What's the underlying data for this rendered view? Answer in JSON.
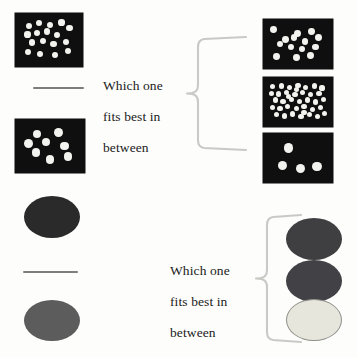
{
  "page": {
    "title": "Which one fits best in between",
    "background_color": "#fdfdfc",
    "width": 357,
    "height": 358
  },
  "palette": {
    "panel_background": "#100f0f",
    "dot_color": "#f2f2ee",
    "rule_color": "#7d7d7d",
    "brace_color": "#c9c9c5",
    "text_color": "#1b1b1b",
    "ellipse_dark": "#2a2a2a",
    "ellipse_medium_dark": "#3f3f42",
    "ellipse_medium": "#5c5c5c",
    "ellipse_light": "#e6e6dc",
    "ellipse_light_outline": "#8e8e8a"
  },
  "items": {
    "top_prompt": {
      "label": "Which one\nfits best in\nbetween",
      "line1": "Which one",
      "line2": "fits best in",
      "line3": "between"
    },
    "bottom_prompt": {
      "label": "Which one\nfits best in\nbetween",
      "line1": "Which one",
      "line2": "fits best in",
      "line3": "between"
    }
  },
  "stimuli": {
    "top_left_anchor_high": {
      "name": "dot-panel-dense-16",
      "dot_count": 16,
      "dot_radius": 3.1,
      "dots": [
        [
          0.15,
          0.17
        ],
        [
          0.33,
          0.1
        ],
        [
          0.52,
          0.15
        ],
        [
          0.72,
          0.09
        ],
        [
          0.12,
          0.37
        ],
        [
          0.29,
          0.33
        ],
        [
          0.47,
          0.3
        ],
        [
          0.64,
          0.38
        ],
        [
          0.86,
          0.22
        ],
        [
          0.2,
          0.56
        ],
        [
          0.4,
          0.52
        ],
        [
          0.58,
          0.6
        ],
        [
          0.8,
          0.54
        ],
        [
          0.13,
          0.78
        ],
        [
          0.34,
          0.82
        ],
        [
          0.6,
          0.85
        ],
        [
          0.84,
          0.76
        ]
      ]
    },
    "top_left_anchor_low": {
      "name": "dot-panel-sparse-8",
      "dot_count": 8,
      "dot_radius": 4.4,
      "dots": [
        [
          0.27,
          0.2
        ],
        [
          0.65,
          0.16
        ],
        [
          0.12,
          0.44
        ],
        [
          0.43,
          0.4
        ],
        [
          0.76,
          0.5
        ],
        [
          0.25,
          0.67
        ],
        [
          0.5,
          0.83
        ],
        [
          0.82,
          0.77
        ]
      ]
    },
    "top_right_option_a": {
      "name": "dot-panel-option-a-13",
      "dot_count": 13,
      "dot_radius": 3.4,
      "dots": [
        [
          0.08,
          0.13
        ],
        [
          0.49,
          0.22
        ],
        [
          0.73,
          0.17
        ],
        [
          0.28,
          0.38
        ],
        [
          0.43,
          0.34
        ],
        [
          0.62,
          0.44
        ],
        [
          0.85,
          0.33
        ],
        [
          0.19,
          0.5
        ],
        [
          0.38,
          0.58
        ],
        [
          0.57,
          0.63
        ],
        [
          0.8,
          0.58
        ],
        [
          0.13,
          0.82
        ],
        [
          0.48,
          0.85
        ],
        [
          0.72,
          0.8
        ]
      ]
    },
    "top_right_option_b": {
      "name": "dot-panel-option-b-38",
      "dot_count": 38,
      "dot_radius": 2.6,
      "dots": [
        [
          0.08,
          0.12
        ],
        [
          0.22,
          0.1
        ],
        [
          0.36,
          0.14
        ],
        [
          0.5,
          0.09
        ],
        [
          0.63,
          0.13
        ],
        [
          0.78,
          0.1
        ],
        [
          0.9,
          0.15
        ],
        [
          0.06,
          0.28
        ],
        [
          0.18,
          0.3
        ],
        [
          0.31,
          0.26
        ],
        [
          0.45,
          0.31
        ],
        [
          0.58,
          0.27
        ],
        [
          0.71,
          0.32
        ],
        [
          0.85,
          0.28
        ],
        [
          0.12,
          0.45
        ],
        [
          0.25,
          0.48
        ],
        [
          0.39,
          0.43
        ],
        [
          0.52,
          0.49
        ],
        [
          0.66,
          0.45
        ],
        [
          0.79,
          0.5
        ],
        [
          0.92,
          0.44
        ],
        [
          0.07,
          0.63
        ],
        [
          0.2,
          0.66
        ],
        [
          0.33,
          0.61
        ],
        [
          0.47,
          0.67
        ],
        [
          0.6,
          0.62
        ],
        [
          0.74,
          0.68
        ],
        [
          0.88,
          0.63
        ],
        [
          0.14,
          0.82
        ],
        [
          0.27,
          0.85
        ],
        [
          0.41,
          0.8
        ],
        [
          0.55,
          0.86
        ],
        [
          0.69,
          0.81
        ],
        [
          0.83,
          0.86
        ],
        [
          0.94,
          0.78
        ],
        [
          0.34,
          0.37
        ],
        [
          0.6,
          0.77
        ],
        [
          0.47,
          0.19
        ]
      ]
    },
    "top_right_option_c": {
      "name": "dot-panel-option-c-4",
      "dot_count": 4,
      "dot_radius": 4.6,
      "dots": [
        [
          0.33,
          0.22
        ],
        [
          0.22,
          0.72
        ],
        [
          0.55,
          0.79
        ],
        [
          0.84,
          0.73
        ]
      ]
    },
    "bottom_left_anchor_high": {
      "name": "ellipse-anchor-dark",
      "shade": "#2a2a2a"
    },
    "bottom_left_anchor_low": {
      "name": "ellipse-anchor-medium",
      "shade": "#5c5c5c"
    },
    "bottom_right_option_a": {
      "name": "ellipse-option-a-dark",
      "shade": "#3f3f42"
    },
    "bottom_right_option_b": {
      "name": "ellipse-option-b-medium-dark",
      "shade": "#424246"
    },
    "bottom_right_option_c": {
      "name": "ellipse-option-c-light",
      "shade": "#e6e6dc"
    }
  }
}
